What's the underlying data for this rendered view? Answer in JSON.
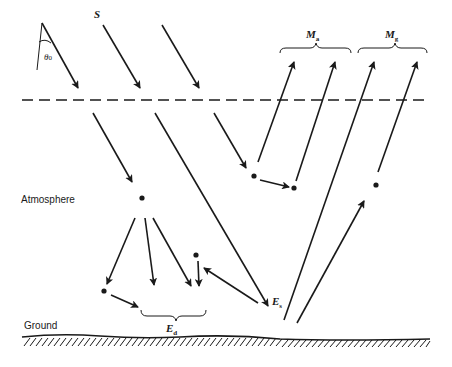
{
  "diagram": {
    "labels": {
      "source": "S",
      "zenith_angle": "θ",
      "zenith_angle_sub": "0",
      "atmosphere": "Atmosphere",
      "ground": "Ground",
      "path_radiance_main": "M",
      "path_radiance_sub": "a",
      "ground_radiance_main": "M",
      "ground_radiance_sub": "g",
      "direct_irradiance_main": "E",
      "direct_irradiance_sub": "s",
      "diffuse_irradiance_main": "E",
      "diffuse_irradiance_sub": "d"
    },
    "colors": {
      "stroke": "#1a1a1a",
      "background": "#ffffff"
    }
  }
}
